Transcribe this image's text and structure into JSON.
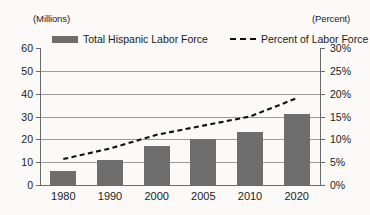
{
  "chart_data": {
    "type": "bar",
    "title": "",
    "subtitle": "",
    "categories": [
      "1980",
      "1990",
      "2000",
      "2005",
      "2010",
      "2020"
    ],
    "series": [
      {
        "name": "Total Hispanic Labor Force",
        "type": "bar",
        "axis": "left",
        "unit": "Millions",
        "color": "#6e6e6e",
        "values": [
          6,
          11,
          17,
          20,
          23,
          31
        ]
      },
      {
        "name": "Percent of Labor Force",
        "type": "line",
        "style": "dashed",
        "axis": "right",
        "unit": "Percent",
        "color": "#111111",
        "values": [
          5.7,
          8.0,
          11.0,
          13.0,
          15.0,
          19.0
        ]
      }
    ],
    "xlabel": "",
    "ylabel": "(Millions)",
    "y2label": "(Percent)",
    "ylim": [
      0,
      60
    ],
    "y2lim": [
      0,
      30
    ],
    "yticks": [
      "0",
      "10",
      "20",
      "30",
      "40",
      "50",
      "60"
    ],
    "y2ticks": [
      "0%",
      "5%",
      "10%",
      "15%",
      "20%",
      "25%",
      "30%"
    ],
    "grid": true,
    "legend_position": "top"
  },
  "axes": {
    "left_unit": "(Millions)",
    "right_unit": "(Percent)"
  },
  "legend": {
    "bar_label": "Total Hispanic Labor Force",
    "line_label": "Percent of Labor Force"
  }
}
